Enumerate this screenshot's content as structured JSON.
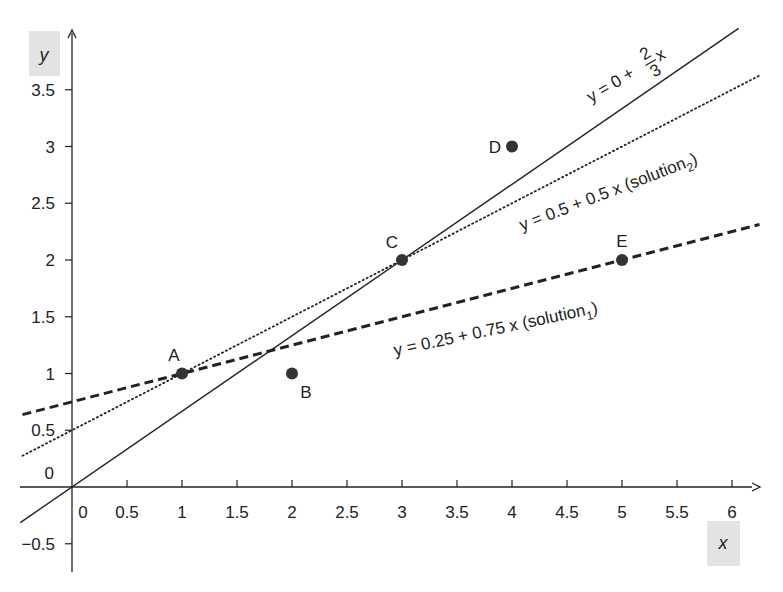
{
  "chart_data": {
    "type": "scatter",
    "title": "",
    "xlabel": "x",
    "ylabel": "y",
    "xlim": [
      -0.5,
      6.25
    ],
    "ylim": [
      -0.75,
      3.75
    ],
    "xticks": [
      0,
      0.5,
      1,
      1.5,
      2,
      2.5,
      3,
      3.5,
      4,
      4.5,
      5,
      5.5,
      6
    ],
    "xtick_labels": [
      "0",
      "0.5",
      "1",
      "1.5",
      "2",
      "2.5",
      "3",
      "3.5",
      "4",
      "4.5",
      "5",
      "5.5",
      "6"
    ],
    "yticks": [
      -0.5,
      0,
      0.5,
      1,
      1.5,
      2,
      2.5,
      3,
      3.5
    ],
    "ytick_labels": [
      "−0.5",
      "0",
      "0.5",
      "1",
      "1.5",
      "2",
      "2.5",
      "3",
      "3.5"
    ],
    "grid": false,
    "points": [
      {
        "label": "A",
        "x": 1,
        "y": 1
      },
      {
        "label": "B",
        "x": 2,
        "y": 1
      },
      {
        "label": "C",
        "x": 3,
        "y": 2
      },
      {
        "label": "D",
        "x": 4,
        "y": 3
      },
      {
        "label": "E",
        "x": 5,
        "y": 2
      }
    ],
    "lines": [
      {
        "name": "y = 0 + 2/3 x",
        "style": "solid",
        "intercept": 0,
        "slope": 0.6667,
        "x_range": [
          -0.47,
          6.06
        ]
      },
      {
        "name": "y = 0.5 + 0.5 x (solution2)",
        "style": "dotted",
        "intercept": 0.5,
        "slope": 0.5,
        "x_range": [
          -0.45,
          6.25
        ]
      },
      {
        "name": "y = 0.25 + 0.75 x (solution1)",
        "style": "dashed",
        "intercept": 0.75,
        "slope": 0.25,
        "x_range": [
          -0.45,
          6.25
        ]
      }
    ],
    "annotations": [
      {
        "text": "y = 0 + 2/3 x",
        "near_line": "solid"
      },
      {
        "text": "y = 0.5 + 0.5 x  (solution2)",
        "near_line": "dotted"
      },
      {
        "text": "y = 0.25 + 0.75 x  (solution1)",
        "near_line": "dashed"
      }
    ]
  },
  "labels": {
    "x_axis": "x",
    "y_axis": "y",
    "eq_solid_prefix": "y = 0 + ",
    "eq_solid_num": "2",
    "eq_solid_den": "3",
    "eq_solid_var": "x",
    "eq_dotted": "y = 0.5 + 0.5 x  (solution",
    "eq_dotted_sub": "2",
    "eq_dotted_close": ")",
    "eq_dashed": "y = 0.25 + 0.75 x  (solution",
    "eq_dashed_sub": "1",
    "eq_dashed_close": ")"
  },
  "colors": {
    "ink": "#222222",
    "point": "#333333",
    "axis_label_bg": "#e3e3e3"
  }
}
